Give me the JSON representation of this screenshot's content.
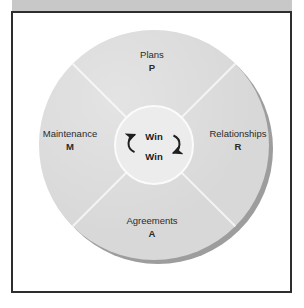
{
  "figure": {
    "type": "four-quadrant-wheel-diagram",
    "center_hub": {
      "win_top_label": "Win",
      "win_bottom_label": "Win",
      "arrow_cycle": "bidirectional-circular"
    },
    "sectors": [
      {
        "position": "top",
        "name": "Plans",
        "letter": "P"
      },
      {
        "position": "right",
        "name": "Relationships",
        "letter": "R"
      },
      {
        "position": "bottom",
        "name": "Agreements",
        "letter": "A"
      },
      {
        "position": "left",
        "name": "Maintenance",
        "letter": "M"
      }
    ],
    "colors": {
      "wheel_fill": "#d8d8d8",
      "hub_fill": "#ececec",
      "divider": "#f3f3f3",
      "shadow": "#9d9d9d",
      "frame_border": "#2e2e2e",
      "top_band": "#c8c8c8",
      "text": "#2b2b2b",
      "arrow": "#1f1f1f"
    }
  }
}
